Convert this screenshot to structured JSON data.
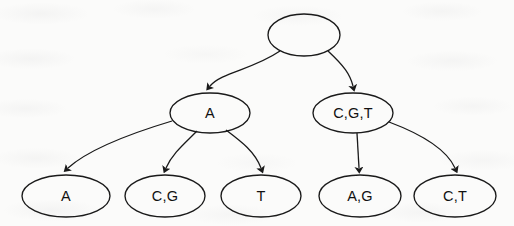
{
  "diagram": {
    "type": "tree",
    "colors": {
      "stroke": "#1a1a1a",
      "text": "#111111",
      "background": "#fbfbfa"
    },
    "nodes": [
      {
        "id": "root",
        "label": "",
        "level": 0,
        "cx": 304,
        "cy": 35,
        "rx": 36,
        "ry": 21
      },
      {
        "id": "n-a",
        "label": "A",
        "level": 1,
        "cx": 210,
        "cy": 113,
        "rx": 40,
        "ry": 20
      },
      {
        "id": "n-cgt",
        "label": "C,G,T",
        "level": 1,
        "cx": 353,
        "cy": 113,
        "rx": 40,
        "ry": 20
      },
      {
        "id": "l-a",
        "label": "A",
        "level": 2,
        "cx": 66,
        "cy": 196,
        "rx": 44,
        "ry": 21
      },
      {
        "id": "l-cg",
        "label": "C,G",
        "level": 2,
        "cx": 165,
        "cy": 196,
        "rx": 40,
        "ry": 21
      },
      {
        "id": "l-t",
        "label": "T",
        "level": 2,
        "cx": 261,
        "cy": 196,
        "rx": 40,
        "ry": 21
      },
      {
        "id": "l-ag",
        "label": "A,G",
        "level": 2,
        "cx": 360,
        "cy": 196,
        "rx": 41,
        "ry": 21
      },
      {
        "id": "l-ct",
        "label": "C,T",
        "level": 2,
        "cx": 455,
        "cy": 196,
        "rx": 41,
        "ry": 21
      }
    ],
    "edges": [
      {
        "id": "e-root-a",
        "from": "root",
        "to": "n-a",
        "style": "curved",
        "arrow": true
      },
      {
        "id": "e-root-cgt",
        "from": "root",
        "to": "n-cgt",
        "style": "curved",
        "arrow": true
      },
      {
        "id": "e-a-a",
        "from": "n-a",
        "to": "l-a",
        "style": "curved",
        "arrow": true
      },
      {
        "id": "e-a-cg",
        "from": "n-a",
        "to": "l-cg",
        "style": "curved",
        "arrow": true
      },
      {
        "id": "e-a-t",
        "from": "n-a",
        "to": "l-t",
        "style": "curved",
        "arrow": true
      },
      {
        "id": "e-cgt-ag",
        "from": "n-cgt",
        "to": "l-ag",
        "style": "straight",
        "arrow": true
      },
      {
        "id": "e-cgt-ct",
        "from": "n-cgt",
        "to": "l-ct",
        "style": "curved",
        "arrow": true
      }
    ]
  }
}
